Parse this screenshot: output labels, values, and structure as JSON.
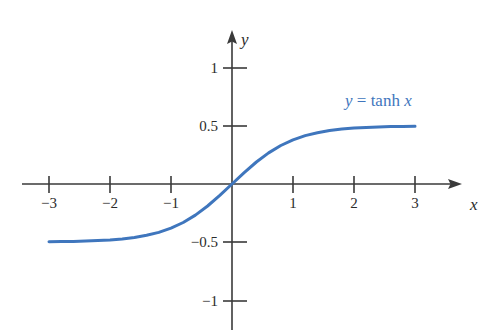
{
  "figure": {
    "background_color": "#ffffff",
    "axis_color": "#3a3a3a",
    "curve_color": "#3f76bd",
    "label_color": "#2b2b2b"
  },
  "axes": {
    "x_name": "x",
    "y_name": "y",
    "x_ticks": [
      {
        "value": -3,
        "label": "−3"
      },
      {
        "value": -2,
        "label": "−2"
      },
      {
        "value": -1,
        "label": "−1"
      },
      {
        "value": 1,
        "label": "1"
      },
      {
        "value": 2,
        "label": "2"
      },
      {
        "value": 3,
        "label": "3"
      }
    ],
    "y_ticks": [
      {
        "value": 1,
        "label": "1"
      },
      {
        "value": 0.5,
        "label": "0.5"
      },
      {
        "value": -0.5,
        "label": "−0.5"
      },
      {
        "value": -1,
        "label": "−1"
      }
    ]
  },
  "annotation": {
    "curve_label_y": "y",
    "curve_label_eq": "=",
    "curve_label_fn": "tanh",
    "curve_label_x": "x",
    "curve_label_full": "y = tanh x"
  },
  "chart_data": {
    "type": "line",
    "title": "",
    "xlabel": "x",
    "ylabel": "y",
    "xlim": [
      -3.35,
      3.6
    ],
    "ylim": [
      -1.35,
      1.35
    ],
    "grid": false,
    "legend": "none",
    "annotations": [
      {
        "text": "y = tanh x",
        "x": 1.85,
        "y": 0.72,
        "color": "#3f76bd"
      }
    ],
    "xticks": [
      -3,
      -2,
      -1,
      1,
      2,
      3
    ],
    "yticks": [
      -1,
      -0.5,
      0.5,
      1
    ],
    "series": [
      {
        "name": "y = tanh x",
        "color": "#3f76bd",
        "x": [
          -3,
          -2.8,
          -2.6,
          -2.4,
          -2.2,
          -2,
          -1.8,
          -1.6,
          -1.4,
          -1.2,
          -1,
          -0.8,
          -0.6,
          -0.4,
          -0.2,
          0,
          0.2,
          0.4,
          0.6,
          0.8,
          1,
          1.2,
          1.4,
          1.6,
          1.8,
          2,
          2.2,
          2.4,
          2.6,
          2.8,
          3
        ],
        "values": [
          -0.995,
          -0.993,
          -0.989,
          -0.984,
          -0.976,
          -0.964,
          -0.947,
          -0.922,
          -0.885,
          -0.834,
          -0.762,
          -0.664,
          -0.537,
          -0.38,
          -0.197,
          0,
          0.197,
          0.38,
          0.537,
          0.664,
          0.762,
          0.834,
          0.885,
          0.922,
          0.947,
          0.964,
          0.976,
          0.984,
          0.989,
          0.993,
          0.995
        ]
      }
    ]
  }
}
